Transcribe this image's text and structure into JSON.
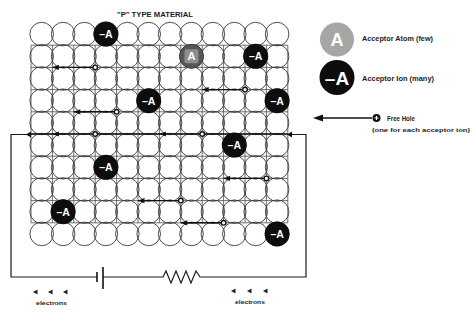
{
  "title": "\"P\" TYPE MATERIAL",
  "lattice": {
    "cols": 12,
    "rows": 10,
    "x0": 31,
    "y0": 23,
    "dx": 21.4,
    "dy": 22.2,
    "cell_radius": 11.8
  },
  "acceptor_ions": [
    {
      "col": 3,
      "row": 0,
      "label": "–A"
    },
    {
      "col": 10,
      "row": 1,
      "label": "–A"
    },
    {
      "col": 5,
      "row": 3,
      "label": "–A"
    },
    {
      "col": 11,
      "row": 3,
      "label": "–A"
    },
    {
      "col": 9,
      "row": 5,
      "label": "–A"
    },
    {
      "col": 3,
      "row": 6,
      "label": "–A"
    },
    {
      "col": 1,
      "row": 8,
      "label": "–A"
    },
    {
      "col": 11,
      "row": 9,
      "label": "–A"
    }
  ],
  "acceptor_atoms": [
    {
      "col": 7,
      "row": 1,
      "label": "A"
    }
  ],
  "hole_paths": [
    {
      "row_line": 2,
      "from": 1,
      "to": 3,
      "holes": [
        3
      ],
      "arrowheads": [
        1
      ]
    },
    {
      "row_line": 3,
      "from": 8,
      "to": 10,
      "holes": [
        10
      ],
      "arrowheads": [
        8
      ]
    },
    {
      "row_line": 4,
      "from": 2,
      "to": 4,
      "holes": [
        4
      ],
      "arrowheads": [
        2
      ]
    },
    {
      "row_line": 5,
      "from": 0,
      "to": 12,
      "holes": [
        3,
        8
      ],
      "arrowheads": [
        1,
        6
      ]
    },
    {
      "row_line": 7,
      "from": 9,
      "to": 11,
      "holes": [
        11
      ],
      "arrowheads": [
        9
      ]
    },
    {
      "row_line": 8,
      "from": 5,
      "to": 7,
      "holes": [
        7
      ],
      "arrowheads": [
        5
      ]
    },
    {
      "row_line": 9,
      "from": 7,
      "to": 9,
      "holes": [
        9
      ],
      "arrowheads": [
        7
      ]
    }
  ],
  "legend": {
    "atom": {
      "symbol": "A",
      "label": "Acceptor Atom (few)"
    },
    "ion": {
      "symbol": "–A",
      "label": "Acceptor Ion (many)"
    },
    "free_hole": {
      "label": "Free Hole",
      "sublabel": "(one for each acceptor ion)"
    }
  },
  "circuit": {
    "components": [
      "battery",
      "resistor"
    ],
    "left_flow_label": "electrons",
    "right_flow_label": "electrons"
  },
  "colors": {
    "ion_fill": "#0d0d0d",
    "atom_fill": "#5c5c5c",
    "atom_inner": "#8e8e8e",
    "legend_atom_light": "#cfcfcf",
    "legend_atom_dot": "#6a6a6a",
    "line": "#111111"
  }
}
